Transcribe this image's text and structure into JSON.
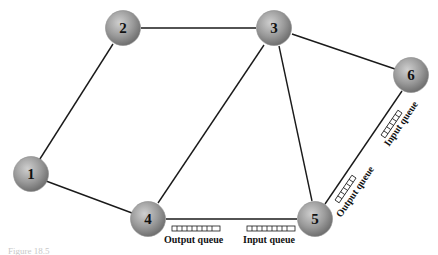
{
  "diagram": {
    "type": "network-graph",
    "colors": {
      "node_fill_light": "#c9c9c9",
      "node_fill_dark": "#7a7a7a",
      "edge": "#1a1a1a",
      "text": "#111111"
    },
    "nodes": [
      {
        "id": "1",
        "label": "1",
        "x": 31,
        "y": 174
      },
      {
        "id": "2",
        "label": "2",
        "x": 123,
        "y": 28
      },
      {
        "id": "3",
        "label": "3",
        "x": 274,
        "y": 28
      },
      {
        "id": "4",
        "label": "4",
        "x": 148,
        "y": 219
      },
      {
        "id": "5",
        "label": "5",
        "x": 315,
        "y": 219
      },
      {
        "id": "6",
        "label": "6",
        "x": 411,
        "y": 75
      }
    ],
    "edges": [
      {
        "from": "1",
        "to": "2"
      },
      {
        "from": "1",
        "to": "4"
      },
      {
        "from": "2",
        "to": "3"
      },
      {
        "from": "3",
        "to": "4"
      },
      {
        "from": "3",
        "to": "5"
      },
      {
        "from": "3",
        "to": "6"
      },
      {
        "from": "4",
        "to": "5"
      },
      {
        "from": "5",
        "to": "6"
      }
    ],
    "queues": [
      {
        "label": "Output queue",
        "near": "4",
        "edge": "4-5"
      },
      {
        "label": "Input queue",
        "near": "5",
        "edge": "4-5"
      },
      {
        "label": "Output queue",
        "near": "5",
        "edge": "5-6"
      },
      {
        "label": "Input queue",
        "near": "6",
        "edge": "5-6"
      }
    ],
    "caption": "Figure 18.5"
  }
}
